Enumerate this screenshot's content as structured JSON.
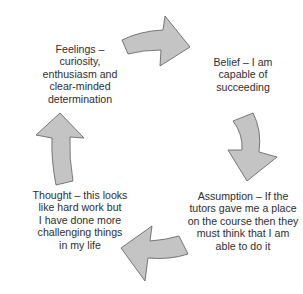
{
  "diagram": {
    "type": "cycle",
    "direction": "clockwise",
    "colors": {
      "arrow_fill": "#c4c4c4",
      "arrow_stroke": "#5a5a5a",
      "text": "#2e2e2e",
      "background": "#ffffff"
    },
    "nodes": [
      {
        "id": "feelings",
        "position": "top-left",
        "lines": [
          "Feelings –",
          "curiosity,",
          "enthusiasm and",
          "clear-minded",
          "determination"
        ]
      },
      {
        "id": "belief",
        "position": "top-right",
        "lines": [
          "Belief – I am",
          "capable of",
          "succeeding"
        ]
      },
      {
        "id": "assumption",
        "position": "bottom-right",
        "lines": [
          "Assumption – If the",
          "tutors gave me a place",
          "on the course then they",
          "must think that I am",
          "able to do it"
        ]
      },
      {
        "id": "thought",
        "position": "bottom-left",
        "lines": [
          "Thought – this looks",
          "like hard work but",
          "I have done more",
          "challenging things",
          "in my life"
        ]
      }
    ],
    "edges": [
      {
        "from": "feelings",
        "to": "belief",
        "arrow": "right-curved-arrow"
      },
      {
        "from": "belief",
        "to": "assumption",
        "arrow": "down-curved-arrow"
      },
      {
        "from": "assumption",
        "to": "thought",
        "arrow": "left-curved-arrow"
      },
      {
        "from": "thought",
        "to": "feelings",
        "arrow": "up-curved-arrow"
      }
    ]
  }
}
